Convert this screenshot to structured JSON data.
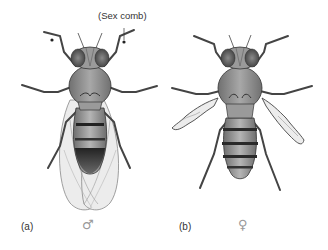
{
  "figure": {
    "panels": [
      {
        "id": "a",
        "label": "(a)",
        "sex_symbol": "♂",
        "sex": "male",
        "annotation": "(Sex comb)"
      },
      {
        "id": "b",
        "label": "(b)",
        "sex_symbol": "♀",
        "sex": "female"
      }
    ]
  },
  "colors": {
    "body_dark": "#3a3a3a",
    "body_mid": "#8a8a8a",
    "body_light": "#c8c8c8",
    "wing": "#ececec",
    "outline": "#2a2a2a",
    "label_text": "#333333",
    "symbol": "#9a9a9a"
  }
}
